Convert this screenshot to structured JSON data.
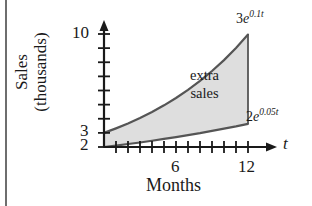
{
  "chart_data": {
    "type": "area",
    "title": "",
    "xlabel": "Months",
    "ylabel": "Sales (thousands)",
    "xvar": "t",
    "xlim": [
      0,
      13.5
    ],
    "ylim": [
      2,
      10.8
    ],
    "grid": false,
    "legend_position": "inline-annotation",
    "x_ticks_major": [
      6,
      12
    ],
    "x_tick_labels": [
      "6",
      "12"
    ],
    "x_ticks_minor": [
      1,
      2,
      3,
      4,
      5,
      6,
      7,
      8,
      9,
      10,
      11,
      12
    ],
    "y_ticks": [
      2,
      3,
      4,
      5,
      6,
      7,
      8,
      9,
      10
    ],
    "y_tick_labels_shown": [
      "2",
      "3",
      "10"
    ],
    "shaded_region_label_line1": "extra",
    "shaded_region_label_line2": "sales",
    "fill_color": "#dedede",
    "curve_color": "#555555",
    "axis_color": "#1a1a1a",
    "series": [
      {
        "name": "upper",
        "equation_base": "3",
        "equation_e": "e",
        "equation_exponent": "0.1t",
        "formula": "3e^{0.1t}",
        "x": [
          0,
          1,
          2,
          3,
          4,
          5,
          6,
          7,
          8,
          9,
          10,
          11,
          12
        ],
        "values": [
          3.0,
          3.32,
          3.66,
          4.05,
          4.48,
          4.95,
          5.47,
          6.04,
          6.68,
          7.38,
          8.15,
          9.01,
          9.96
        ]
      },
      {
        "name": "lower",
        "equation_base": "2",
        "equation_e": "e",
        "equation_exponent": "0.05t",
        "formula": "2e^{0.05t}",
        "x": [
          0,
          1,
          2,
          3,
          4,
          5,
          6,
          7,
          8,
          9,
          10,
          11,
          12
        ],
        "values": [
          2.0,
          2.1,
          2.21,
          2.32,
          2.44,
          2.57,
          2.7,
          2.84,
          2.98,
          3.14,
          3.3,
          3.46,
          3.64
        ]
      }
    ]
  },
  "labels": {
    "y_10": "10",
    "y_3": "3",
    "y_2": "2",
    "x_6": "6",
    "x_12": "12",
    "x_axis_var": "t",
    "x_title": "Months",
    "y_title_line1": "Sales",
    "y_title_line2": "(thousands)",
    "upper_base": "3",
    "upper_e": "e",
    "upper_exp": "0.1t",
    "lower_base": "2",
    "lower_e": "e",
    "lower_exp": "0.05t",
    "region_line1": "extra",
    "region_line2": "sales"
  }
}
